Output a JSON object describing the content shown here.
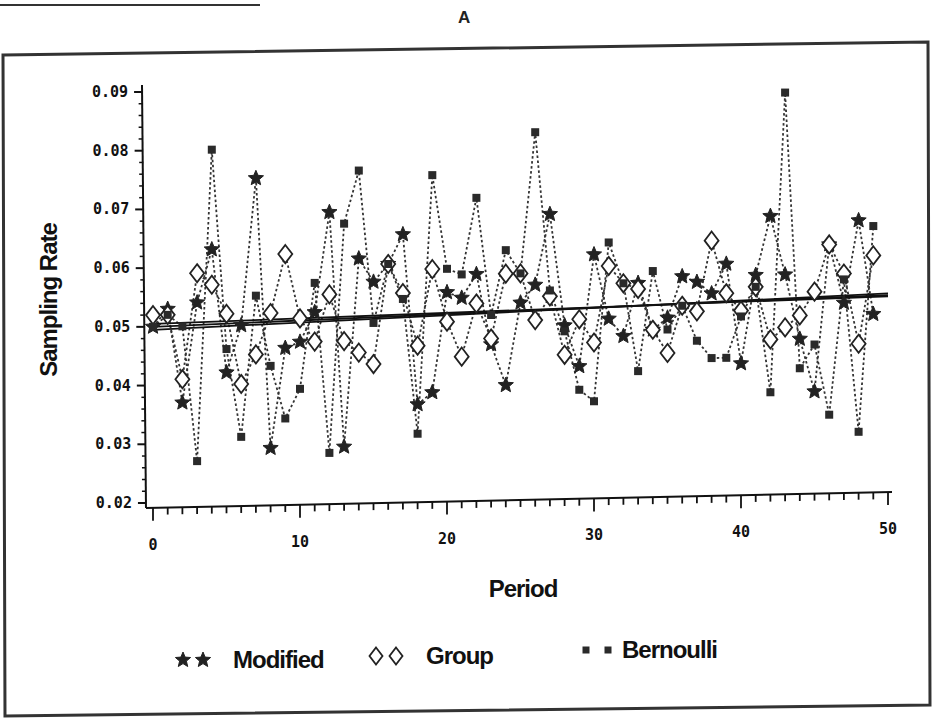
{
  "panel_label": "A",
  "legend": {
    "items": [
      {
        "label": "Modified",
        "marker": "star-icon"
      },
      {
        "label": "Group",
        "marker": "diamond-icon"
      },
      {
        "label": "Bernoulli",
        "marker": "square-icon"
      }
    ]
  },
  "axes": {
    "xlabel": "Period",
    "ylabel": "Sampling Rate",
    "xticks": [
      "0",
      "10",
      "20",
      "30",
      "40",
      "50"
    ],
    "yticks": [
      "0.02",
      "0.03",
      "0.04",
      "0.05",
      "0.06",
      "0.07",
      "0.08",
      "0.09"
    ]
  },
  "chart_data": {
    "type": "line",
    "title": "A",
    "xlabel": "Period",
    "ylabel": "Sampling Rate",
    "xlim": [
      0,
      50
    ],
    "ylim": [
      0.02,
      0.09
    ],
    "grid": false,
    "legend_position": "bottom",
    "line_style": "dotted with markers; plus linear trend line per series",
    "x": [
      0,
      1,
      2,
      3,
      4,
      5,
      6,
      7,
      8,
      9,
      10,
      11,
      12,
      13,
      14,
      15,
      16,
      17,
      18,
      19,
      20,
      21,
      22,
      23,
      24,
      25,
      26,
      27,
      28,
      29,
      30,
      31,
      32,
      33,
      34,
      35,
      36,
      37,
      38,
      39,
      40,
      41,
      42,
      43,
      44,
      45,
      46,
      47,
      48,
      49
    ],
    "series": [
      {
        "name": "Modified",
        "marker": "star",
        "values": [
          0.05,
          0.053,
          0.037,
          0.054,
          0.063,
          0.042,
          0.05,
          0.075,
          0.029,
          0.046,
          0.047,
          0.052,
          0.069,
          0.029,
          0.061,
          0.057,
          0.06,
          0.065,
          0.036,
          0.038,
          0.055,
          0.054,
          0.058,
          0.046,
          0.039,
          0.053,
          0.056,
          0.068,
          0.049,
          0.042,
          0.061,
          0.05,
          0.047,
          0.056,
          0.048,
          0.05,
          0.057,
          0.056,
          0.054,
          0.059,
          0.042,
          0.057,
          0.067,
          0.057,
          0.046,
          0.037,
          0.062,
          0.052,
          0.066,
          0.05
        ],
        "trend": [
          0.0495,
          0.0535
        ]
      },
      {
        "name": "Group",
        "marker": "diamond",
        "values": [
          0.052,
          0.052,
          0.041,
          0.059,
          0.057,
          0.052,
          0.04,
          0.045,
          0.052,
          0.062,
          0.051,
          0.047,
          0.055,
          0.047,
          0.045,
          0.043,
          0.06,
          0.055,
          0.046,
          0.059,
          0.05,
          0.044,
          0.053,
          0.047,
          0.058,
          0.058,
          0.05,
          0.054,
          0.044,
          0.05,
          0.046,
          0.059,
          0.056,
          0.055,
          0.048,
          0.044,
          0.052,
          0.051,
          0.063,
          0.054,
          0.051,
          0.055,
          0.046,
          0.048,
          0.05,
          0.054,
          0.062,
          0.057,
          0.045,
          0.06
        ],
        "trend": [
          0.0505,
          0.053
        ]
      },
      {
        "name": "Bernoulli",
        "marker": "square",
        "values": [
          0.05,
          0.052,
          0.05,
          0.027,
          0.08,
          0.046,
          0.031,
          0.055,
          0.043,
          0.034,
          0.039,
          0.057,
          0.028,
          0.067,
          0.076,
          0.05,
          0.06,
          0.054,
          0.031,
          0.075,
          0.059,
          0.058,
          0.071,
          0.051,
          0.062,
          0.058,
          0.082,
          0.055,
          0.048,
          0.038,
          0.036,
          0.063,
          0.056,
          0.041,
          0.058,
          0.048,
          0.052,
          0.046,
          0.043,
          0.043,
          0.05,
          0.055,
          0.037,
          0.088,
          0.041,
          0.045,
          0.033,
          0.056,
          0.03,
          0.065
        ],
        "trend": [
          0.05,
          0.0532
        ]
      }
    ]
  }
}
